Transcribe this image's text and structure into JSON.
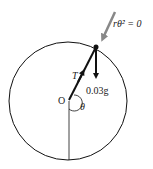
{
  "diagram": {
    "type": "circular-motion-free-body",
    "labels": {
      "center": "O",
      "angle": "θ",
      "tension": "T",
      "weight": "0.03g",
      "radial_term": "rθ̇² = 0"
    },
    "colors": {
      "line": "#111111",
      "arrow_gray": "#888888",
      "background": "#ffffff"
    }
  }
}
